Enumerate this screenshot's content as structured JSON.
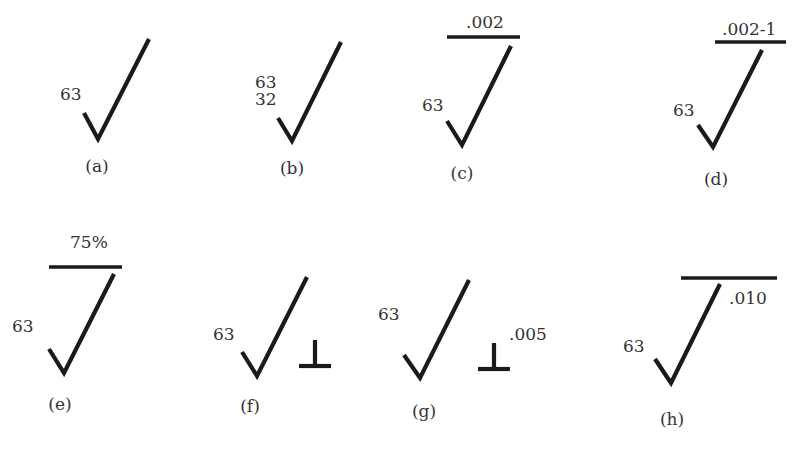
{
  "figures": [
    {
      "id": "a",
      "label": "(a)",
      "roughness": "63",
      "lower_roughness": "",
      "top_note": "",
      "perp_note": "",
      "has_bar": false,
      "has_perp": false
    },
    {
      "id": "b",
      "label": "(b)",
      "roughness": "63",
      "lower_roughness": "32",
      "top_note": "",
      "perp_note": "",
      "has_bar": false,
      "has_perp": false
    },
    {
      "id": "c",
      "label": "(c)",
      "roughness": "63",
      "lower_roughness": "",
      "top_note": ".002",
      "perp_note": "",
      "has_bar": true,
      "has_perp": false
    },
    {
      "id": "d",
      "label": "(d)",
      "roughness": "63",
      "lower_roughness": "",
      "top_note": ".002-1",
      "perp_note": "",
      "has_bar": true,
      "has_perp": false
    },
    {
      "id": "e",
      "label": "(e)",
      "roughness": "63",
      "lower_roughness": "",
      "top_note": "75%",
      "perp_note": "",
      "has_bar": true,
      "has_perp": false
    },
    {
      "id": "f",
      "label": "(f)",
      "roughness": "63",
      "lower_roughness": "",
      "top_note": "",
      "perp_note": "",
      "has_bar": false,
      "has_perp": true
    },
    {
      "id": "g",
      "label": "(g)",
      "roughness": "63",
      "lower_roughness": "",
      "top_note": "",
      "perp_note": ".005",
      "has_bar": false,
      "has_perp": true
    },
    {
      "id": "h",
      "label": "(h)",
      "roughness": "63",
      "lower_roughness": "",
      "top_note": "",
      "perp_note": ".010",
      "has_bar": true,
      "has_perp": false
    }
  ],
  "colors": {
    "ink": "#1a1a1a",
    "text": "#333333",
    "background": "#ffffff"
  }
}
